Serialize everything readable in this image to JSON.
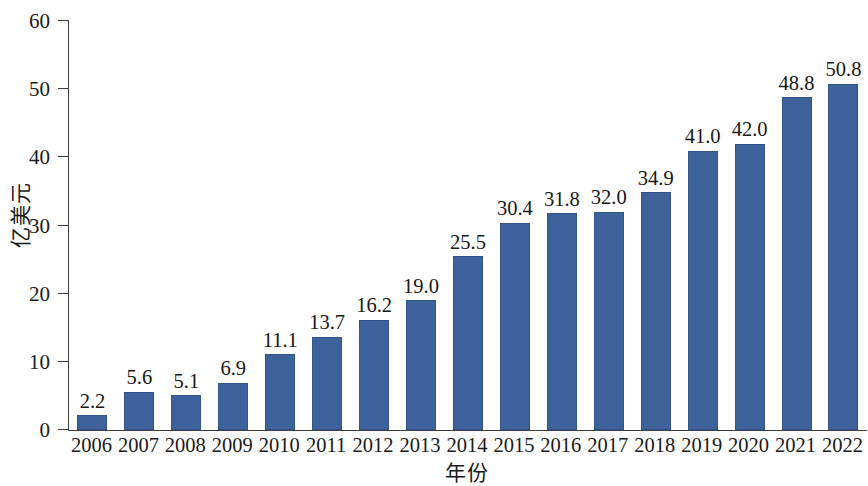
{
  "chart_data": {
    "type": "bar",
    "title": "",
    "subtitle": "",
    "xlabel": "年份",
    "ylabel": "亿美元",
    "categories": [
      "2006",
      "2007",
      "2008",
      "2009",
      "2010",
      "2011",
      "2012",
      "2013",
      "2014",
      "2015",
      "2016",
      "2017",
      "2018",
      "2019",
      "2020",
      "2021",
      "2022"
    ],
    "values": [
      2.2,
      5.6,
      5.1,
      6.9,
      11.1,
      13.7,
      16.2,
      19.0,
      25.5,
      30.4,
      31.8,
      32.0,
      34.9,
      41.0,
      42.0,
      48.8,
      50.8
    ],
    "value_labels": [
      "2.2",
      "5.6",
      "5.1",
      "6.9",
      "11.1",
      "13.7",
      "16.2",
      "19.0",
      "25.5",
      "30.4",
      "31.8",
      "32.0",
      "34.9",
      "41.0",
      "42.0",
      "48.8",
      "50.8"
    ],
    "ylim": [
      0,
      60
    ],
    "yticks": [
      0,
      10,
      20,
      30,
      40,
      50,
      60
    ],
    "ytick_labels": [
      "0",
      "10",
      "20",
      "30",
      "40",
      "50",
      "60"
    ],
    "grid": false,
    "legend": null,
    "legend_position": "none",
    "series": [
      {
        "name": "",
        "values": [
          2.2,
          5.6,
          5.1,
          6.9,
          11.1,
          13.7,
          16.2,
          19.0,
          25.5,
          30.4,
          31.8,
          32.0,
          34.9,
          41.0,
          42.0,
          48.8,
          50.8
        ],
        "color": "#3c619b"
      }
    ],
    "colors": {
      "bar": "#3c619b",
      "axis": "#3c3c3c",
      "text": "#171717",
      "background": "#ffffff"
    }
  }
}
